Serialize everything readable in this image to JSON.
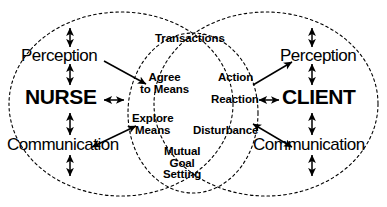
{
  "diagram": {
    "type": "venn-interaction-diagram",
    "colors": {
      "stroke": "#000000",
      "background": "#ffffff",
      "text": "#000000"
    },
    "actors": {
      "left": {
        "name": "NURSE",
        "perception_label": "Perception",
        "communication_label": "Communication"
      },
      "right": {
        "name": "CLIENT",
        "perception_label": "Perception",
        "communication_label": "Communication"
      }
    },
    "center_labels": {
      "transactions": "Transactions",
      "agree_to_means": "Agree\nto Means",
      "agree_to_means_line1": "Agree",
      "agree_to_means_line2": "to Means",
      "explore_means_line1": "Explore",
      "explore_means_line2": "Means",
      "mutual_goal_setting_line1": "Mutual",
      "mutual_goal_setting_line2": "Goal",
      "mutual_goal_setting_line3": "Setting"
    },
    "client_process_labels": {
      "action": "Action",
      "reaction": "Reaction",
      "disturbance": "Disturbance"
    },
    "ellipses": [
      {
        "name": "nurse-ellipse",
        "cx": 121,
        "cy": 104,
        "rx": 112,
        "ry": 92,
        "style": "dashed"
      },
      {
        "name": "client-ellipse",
        "cx": 266,
        "cy": 104,
        "rx": 112,
        "ry": 92,
        "style": "dashed"
      },
      {
        "name": "overlap-ellipse",
        "cx": 193,
        "cy": 113,
        "rx": 65,
        "ry": 80,
        "style": "dashed"
      }
    ],
    "arrows": [
      {
        "name": "nurse-top-vertical",
        "kind": "double-headed",
        "orientation": "vertical"
      },
      {
        "name": "nurse-perception-to-nurse",
        "kind": "double-headed",
        "orientation": "vertical"
      },
      {
        "name": "nurse-to-communication",
        "kind": "double-headed",
        "orientation": "vertical"
      },
      {
        "name": "nurse-communication-to-bottom",
        "kind": "double-headed",
        "orientation": "vertical"
      },
      {
        "name": "client-top-vertical",
        "kind": "double-headed",
        "orientation": "vertical"
      },
      {
        "name": "client-perception-to-client",
        "kind": "double-headed",
        "orientation": "vertical"
      },
      {
        "name": "client-to-communication",
        "kind": "double-headed",
        "orientation": "vertical"
      },
      {
        "name": "client-communication-to-bottom",
        "kind": "double-headed",
        "orientation": "vertical"
      },
      {
        "name": "nurse-to-center",
        "kind": "double-headed",
        "orientation": "horizontal"
      },
      {
        "name": "reaction-to-client",
        "kind": "double-headed",
        "orientation": "horizontal"
      },
      {
        "name": "nurse-perception-to-agree-to-means",
        "kind": "single-headed",
        "orientation": "diagonal"
      },
      {
        "name": "nurse-communication-to-explore-means",
        "kind": "double-headed",
        "orientation": "diagonal"
      },
      {
        "name": "client-action-to-perception",
        "kind": "single-headed",
        "orientation": "diagonal"
      },
      {
        "name": "client-disturbance-to-communication",
        "kind": "double-headed",
        "orientation": "diagonal"
      }
    ]
  }
}
